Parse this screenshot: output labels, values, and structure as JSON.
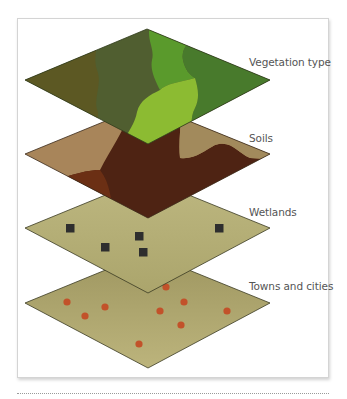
{
  "diagram": {
    "type": "stacked-gis-layers",
    "layers": [
      {
        "id": "vegetation",
        "label": "Vegetation type",
        "regions": [
          "#5c5823",
          "#505e30",
          "#5a9a2c",
          "#8cbb32",
          "#487a2c"
        ]
      },
      {
        "id": "soils",
        "label": "Soils",
        "regions": [
          "#a47f55",
          "#a8875d",
          "#4e2313",
          "#6b2f14",
          "#9e8558"
        ]
      },
      {
        "id": "wetlands",
        "label": "Wetlands",
        "fill": "#b6b07a",
        "marker": "square",
        "marker_color": "#2e2e2e",
        "marker_count": 5
      },
      {
        "id": "towns",
        "label": "Towns and cities",
        "fill": "#b2aa72",
        "marker": "dot",
        "marker_color": "#c2522a",
        "marker_count": 9
      }
    ]
  },
  "colors": {
    "frame_border": "#d4d4d4",
    "label_text": "#555555",
    "outline": "#3a3a22"
  }
}
